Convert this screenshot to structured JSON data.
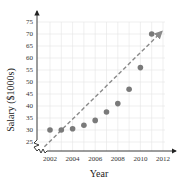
{
  "chart_data": {
    "type": "scatter",
    "title": "",
    "xlabel": "Year",
    "ylabel": "Salary ($1000s)",
    "x_ticks": [
      2002,
      2004,
      2006,
      2008,
      2010,
      2012
    ],
    "y_ticks": [
      25,
      30,
      35,
      40,
      45,
      50,
      55,
      60,
      65,
      70,
      75
    ],
    "xlim": [
      2001,
      2012
    ],
    "ylim": [
      22,
      75
    ],
    "grid": true,
    "axis_break": true,
    "legend": null,
    "series": [
      {
        "name": "Salary",
        "x": [
          2002,
          2003,
          2004,
          2005,
          2006,
          2007,
          2008,
          2009,
          2010,
          2011
        ],
        "values": [
          30,
          30,
          30.5,
          32,
          34,
          37.5,
          41,
          47,
          56,
          70
        ]
      }
    ],
    "trend_line": {
      "style": "dashed-arrow",
      "start": {
        "x": 2001.5,
        "y": 23
      },
      "end": {
        "x": 2011.9,
        "y": 71
      }
    },
    "colors": {
      "points": "#7a7a7a",
      "trend": "#8a8a8a",
      "grid": "#e4e4e4",
      "axis": "#222222"
    }
  }
}
